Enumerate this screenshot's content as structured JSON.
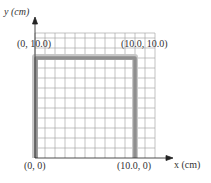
{
  "figure": {
    "axes": {
      "x_label": "x (cm)",
      "y_label": "y (cm)"
    },
    "points": [
      {
        "label": "(0, 0)",
        "x": 0,
        "y": 0
      },
      {
        "label": "(10.0, 0)",
        "x": 10.0,
        "y": 0
      },
      {
        "label": "(0, 10.0)",
        "x": 0,
        "y": 10.0
      },
      {
        "label": "(10.0, 10.0)",
        "x": 10.0,
        "y": 10.0
      }
    ],
    "grid": {
      "cell_size_cm": 1,
      "columns": 12,
      "rows": 12
    },
    "rod": {
      "shape": "inverted-U",
      "vertices": [
        [
          0,
          0
        ],
        [
          0,
          10.0
        ],
        [
          10.0,
          10.0
        ],
        [
          10.0,
          0
        ]
      ]
    },
    "colors": {
      "grid": "#9a9a9a",
      "rod": "#8f8f8f",
      "rod_highlight": "#c8c8c8",
      "axis": "#222222",
      "text": "#333333"
    }
  }
}
